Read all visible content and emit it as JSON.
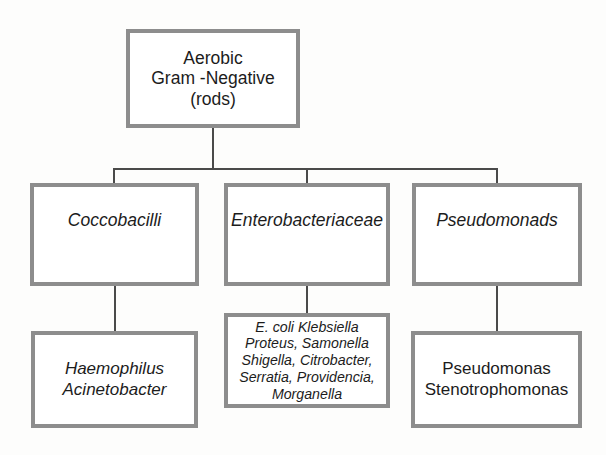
{
  "diagram": {
    "border_color": "#8d8d8d",
    "connector_color": "#4a4a4a",
    "background_color": "#fdfdfc",
    "text_color": "#1c1c1c"
  },
  "nodes": {
    "root": {
      "label": "Aerobic\nGram -Negative\n(rods)",
      "style": "upright"
    },
    "tier2": {
      "coccobacilli": {
        "label": "Coccobacilli",
        "style": "italic"
      },
      "enterobacteriaceae": {
        "label": "Enterobacteriaceae",
        "style": "italic"
      },
      "pseudomonads": {
        "label": "Pseudomonads",
        "style": "italic"
      }
    },
    "tier3": {
      "coccobacilli_species": {
        "label": "Haemophilus\nAcinetobacter",
        "style": "italic"
      },
      "enterobacteriaceae_species": {
        "label": "E. coli Klebsiella\nProteus, Samonella\nShigella, Citrobacter,\nSerratia, Providencia,\nMorganella",
        "style": "italic"
      },
      "pseudomonads_species": {
        "label": "Pseudomonas\nStenotrophomonas",
        "style": "upright"
      }
    }
  }
}
